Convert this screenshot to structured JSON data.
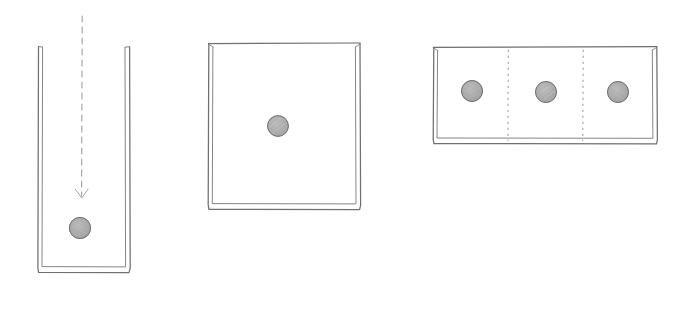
{
  "figure": {
    "background_color": "#ffffff",
    "width": 684,
    "height": 310,
    "stroke_color": "#6a6a6a",
    "stroke_color_light": "#8e8e8e",
    "ball_fill": "#a8a8a8",
    "ball_edge": "#6f6f6f"
  },
  "panels": [
    {
      "id": "panel-tall-container",
      "name": "tall-narrow-container",
      "label": "",
      "container": {
        "x": 38,
        "y": 46,
        "width": 92,
        "height": 226,
        "open_top": true,
        "wall_style": "double-line"
      },
      "drop_path": {
        "name": "dashed-drop-trajectory",
        "x": 82,
        "y_start": 16,
        "y_end": 196,
        "style": "dashed",
        "arrow_head": true
      },
      "balls": [
        {
          "cx": 80,
          "cy": 228,
          "r": 11,
          "name": "settled-particle"
        }
      ]
    },
    {
      "id": "panel-square-container",
      "name": "square-container",
      "label": "",
      "container": {
        "x": 208,
        "y": 43,
        "width": 152,
        "height": 166,
        "open_top": false,
        "wall_style": "double-line"
      },
      "balls": [
        {
          "cx": 278,
          "cy": 126,
          "r": 11,
          "name": "suspended-particle"
        }
      ]
    },
    {
      "id": "panel-wide-container",
      "name": "wide-partitioned-container",
      "label": "",
      "container": {
        "x": 433,
        "y": 47,
        "width": 224,
        "height": 96,
        "open_top": false,
        "wall_style": "double-line"
      },
      "dividers": [
        {
          "x": 508,
          "y_start": 50,
          "y_end": 141,
          "style": "dotted",
          "name": "compartment-divider-1"
        },
        {
          "x": 583,
          "y_start": 50,
          "y_end": 141,
          "style": "dotted",
          "name": "compartment-divider-2"
        }
      ],
      "balls": [
        {
          "cx": 472,
          "cy": 91,
          "r": 11,
          "name": "compartment-particle-1"
        },
        {
          "cx": 546,
          "cy": 92,
          "r": 11,
          "name": "compartment-particle-2"
        },
        {
          "cx": 618,
          "cy": 92,
          "r": 11,
          "name": "compartment-particle-3"
        }
      ]
    }
  ],
  "captions": []
}
